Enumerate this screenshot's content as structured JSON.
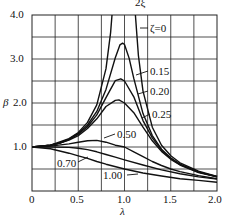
{
  "header": {
    "fragment": "2ξ"
  },
  "chart_data": {
    "type": "line",
    "title": "",
    "xlabel": "λ",
    "ylabel": "β",
    "xlim": [
      0,
      2.0
    ],
    "ylim": [
      0,
      4.0
    ],
    "grid": true,
    "x_ticks": [
      "0",
      "0.5",
      "1.0",
      "1.5",
      "2.0"
    ],
    "y_ticks": [
      "1.0",
      "2.0",
      "3.0",
      "4.0"
    ],
    "x_grid_step": 0.25,
    "y_grid_step": 0.5,
    "series": [
      {
        "name": "ζ=0",
        "label": "ζ=0",
        "points": [
          [
            0,
            1.0
          ],
          [
            0.2,
            1.04
          ],
          [
            0.4,
            1.19
          ],
          [
            0.5,
            1.33
          ],
          [
            0.6,
            1.56
          ],
          [
            0.7,
            1.96
          ],
          [
            0.8,
            2.78
          ],
          [
            0.85,
            3.6
          ],
          [
            0.865,
            4.0
          ]
        ],
        "points2": [
          [
            1.118,
            4.0
          ],
          [
            1.15,
            3.08
          ],
          [
            1.2,
            2.27
          ],
          [
            1.3,
            1.45
          ],
          [
            1.4,
            1.04
          ],
          [
            1.5,
            0.8
          ],
          [
            1.6,
            0.64
          ],
          [
            1.8,
            0.45
          ],
          [
            2.0,
            0.33
          ]
        ]
      },
      {
        "name": "ζ=0.15",
        "label": "0.15",
        "points": [
          [
            0,
            1.0
          ],
          [
            0.2,
            1.04
          ],
          [
            0.3,
            1.09
          ],
          [
            0.4,
            1.18
          ],
          [
            0.5,
            1.31
          ],
          [
            0.6,
            1.5
          ],
          [
            0.7,
            1.81
          ],
          [
            0.8,
            2.31
          ],
          [
            0.9,
            3.03
          ],
          [
            0.95,
            3.32
          ],
          [
            0.98,
            3.36
          ],
          [
            1.0,
            3.33
          ],
          [
            1.05,
            3.02
          ],
          [
            1.1,
            2.56
          ],
          [
            1.2,
            1.76
          ],
          [
            1.3,
            1.26
          ],
          [
            1.4,
            0.95
          ],
          [
            1.5,
            0.75
          ],
          [
            1.6,
            0.61
          ],
          [
            1.8,
            0.43
          ],
          [
            2.0,
            0.33
          ]
        ]
      },
      {
        "name": "ζ=0.20",
        "label": "0.20",
        "points": [
          [
            0,
            1.0
          ],
          [
            0.2,
            1.04
          ],
          [
            0.3,
            1.09
          ],
          [
            0.4,
            1.17
          ],
          [
            0.5,
            1.29
          ],
          [
            0.6,
            1.46
          ],
          [
            0.7,
            1.73
          ],
          [
            0.8,
            2.12
          ],
          [
            0.9,
            2.51
          ],
          [
            0.96,
            2.55
          ],
          [
            1.0,
            2.5
          ],
          [
            1.1,
            2.14
          ],
          [
            1.2,
            1.6
          ],
          [
            1.3,
            1.21
          ],
          [
            1.4,
            0.93
          ],
          [
            1.5,
            0.74
          ],
          [
            1.6,
            0.6
          ],
          [
            1.8,
            0.43
          ],
          [
            2.0,
            0.32
          ]
        ]
      },
      {
        "name": "ζ=0.25",
        "label": "0.25",
        "points": [
          [
            0,
            1.0
          ],
          [
            0.2,
            1.04
          ],
          [
            0.3,
            1.09
          ],
          [
            0.4,
            1.16
          ],
          [
            0.5,
            1.26
          ],
          [
            0.6,
            1.42
          ],
          [
            0.7,
            1.64
          ],
          [
            0.8,
            1.92
          ],
          [
            0.9,
            2.06
          ],
          [
            0.94,
            2.07
          ],
          [
            1.0,
            2.0
          ],
          [
            1.1,
            1.78
          ],
          [
            1.2,
            1.45
          ],
          [
            1.3,
            1.14
          ],
          [
            1.4,
            0.9
          ],
          [
            1.5,
            0.72
          ],
          [
            1.6,
            0.59
          ],
          [
            1.8,
            0.42
          ],
          [
            2.0,
            0.32
          ]
        ]
      },
      {
        "name": "ζ=0.50",
        "label": "0.50",
        "points": [
          [
            0,
            1.0
          ],
          [
            0.2,
            1.02
          ],
          [
            0.4,
            1.07
          ],
          [
            0.5,
            1.11
          ],
          [
            0.6,
            1.14
          ],
          [
            0.7,
            1.15
          ],
          [
            0.8,
            1.11
          ],
          [
            0.9,
            1.04
          ],
          [
            1.0,
            1.0
          ],
          [
            1.1,
            0.89
          ],
          [
            1.2,
            0.78
          ],
          [
            1.3,
            0.67
          ],
          [
            1.4,
            0.58
          ],
          [
            1.5,
            0.5
          ],
          [
            1.6,
            0.44
          ],
          [
            1.8,
            0.35
          ],
          [
            2.0,
            0.28
          ]
        ]
      },
      {
        "name": "ζ=0.70",
        "label": "0.70",
        "points": [
          [
            0,
            1.0
          ],
          [
            0.2,
            1.0
          ],
          [
            0.4,
            0.99
          ],
          [
            0.5,
            0.97
          ],
          [
            0.6,
            0.94
          ],
          [
            0.7,
            0.89
          ],
          [
            0.8,
            0.83
          ],
          [
            0.9,
            0.77
          ],
          [
            1.0,
            0.71
          ],
          [
            1.2,
            0.59
          ],
          [
            1.4,
            0.48
          ],
          [
            1.6,
            0.39
          ],
          [
            1.8,
            0.32
          ],
          [
            2.0,
            0.27
          ]
        ]
      },
      {
        "name": "ζ=1.00",
        "label": "1.00",
        "points": [
          [
            0,
            1.0
          ],
          [
            0.2,
            0.96
          ],
          [
            0.4,
            0.86
          ],
          [
            0.5,
            0.8
          ],
          [
            0.6,
            0.74
          ],
          [
            0.7,
            0.67
          ],
          [
            0.8,
            0.61
          ],
          [
            1.0,
            0.5
          ],
          [
            1.2,
            0.41
          ],
          [
            1.4,
            0.34
          ],
          [
            1.6,
            0.28
          ],
          [
            1.8,
            0.24
          ],
          [
            2.0,
            0.2
          ]
        ]
      }
    ],
    "annotations": [
      {
        "text": "ζ=0",
        "x": 1.35,
        "y": 3.8
      },
      {
        "text": "0.15",
        "x": 1.45,
        "y": 2.75
      },
      {
        "text": "0.20",
        "x": 1.45,
        "y": 2.4
      },
      {
        "text": "0.25",
        "x": 1.45,
        "y": 1.9
      },
      {
        "text": "0.50",
        "x": 1.1,
        "y": 1.5
      },
      {
        "text": "0.70",
        "x": 0.25,
        "y": 0.7
      },
      {
        "text": "1.00",
        "x": 0.8,
        "y": 0.35
      }
    ]
  },
  "colors": {
    "line": "#111111",
    "grid": "#222222",
    "background": "#ffffff"
  }
}
